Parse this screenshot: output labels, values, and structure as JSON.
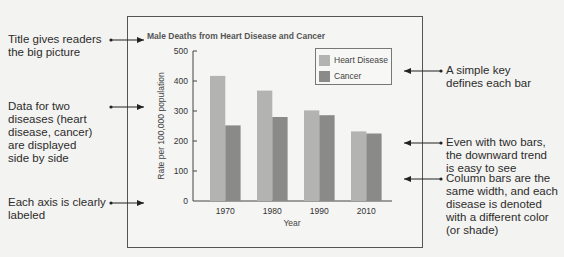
{
  "annotations_left": [
    {
      "id": "title",
      "lines": [
        "Title gives readers",
        "the big picture"
      ]
    },
    {
      "id": "data",
      "lines": [
        "Data for two",
        "diseases (heart",
        "disease, cancer)",
        "are displayed",
        "side by side"
      ]
    },
    {
      "id": "axis",
      "lines": [
        "Each axis is clearly",
        "labeled"
      ]
    }
  ],
  "annotations_right": [
    {
      "id": "key",
      "lines": [
        "A simple key",
        "defines each bar"
      ]
    },
    {
      "id": "trend",
      "lines": [
        "Even with two bars,",
        "the downward trend",
        "is easy to see"
      ]
    },
    {
      "id": "width",
      "lines": [
        "Column bars are the",
        "same width, and each",
        "disease is denoted",
        "with a different color",
        "(or shade)"
      ]
    }
  ],
  "colors": {
    "heart": "#b3b3b1",
    "cancer": "#8a8a88",
    "axis": "#444444",
    "frame": "#555555"
  },
  "chart_data": {
    "type": "bar",
    "title": "Male Deaths from Heart Disease and Cancer",
    "xlabel": "Year",
    "ylabel": "Rate per 100,000 population",
    "categories": [
      "1970",
      "1980",
      "1990",
      "2010"
    ],
    "series": [
      {
        "name": "Heart Disease",
        "values": [
          417,
          368,
          302,
          232
        ]
      },
      {
        "name": "Cancer",
        "values": [
          252,
          280,
          286,
          225
        ]
      }
    ],
    "ylim": [
      0,
      500
    ],
    "yticks": [
      0,
      100,
      200,
      300,
      400,
      500
    ],
    "grid": false,
    "legend_position": "upper right"
  }
}
